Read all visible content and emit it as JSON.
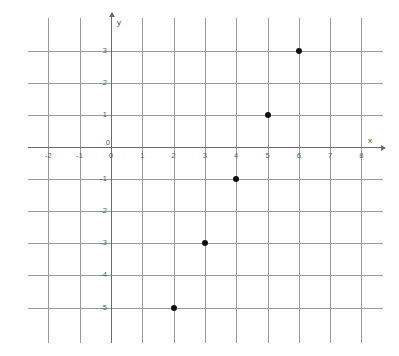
{
  "chart_data": {
    "type": "scatter",
    "title": "",
    "xlabel": "x",
    "ylabel": "y",
    "xlim": [
      -2.5,
      8.5
    ],
    "ylim": [
      -5.8,
      3.6
    ],
    "grid": true,
    "legend": "none",
    "x_ticks": [
      "-2",
      "-1",
      "0",
      "1",
      "2",
      "3",
      "4",
      "5",
      "6",
      "7",
      "8"
    ],
    "x_tick_values": [
      -2,
      -1,
      0,
      1,
      2,
      3,
      4,
      5,
      6,
      7,
      8
    ],
    "y_ticks": [
      "3",
      "2",
      "1",
      "0",
      "-1",
      "-2",
      "-3",
      "-4",
      "-5"
    ],
    "y_tick_values": [
      3,
      2,
      1,
      0,
      -1,
      -2,
      -3,
      -4,
      -5
    ],
    "origin_label": "0",
    "points": [
      {
        "label": "(6, 3)",
        "x": 6,
        "y": 3
      },
      {
        "label": "(5, 1)",
        "x": 5,
        "y": 1
      },
      {
        "label": "(4, -1)",
        "x": 4,
        "y": -1
      },
      {
        "label": "(3, -3)",
        "x": 3,
        "y": -3
      },
      {
        "label": "(2, -5)",
        "x": 2,
        "y": -5
      }
    ],
    "colors": {
      "point": "#101010",
      "grid": "#9a9a9a",
      "axis": "#6b6b6b",
      "tick_text": "#5a5a5a",
      "background": "#ffffff"
    }
  }
}
